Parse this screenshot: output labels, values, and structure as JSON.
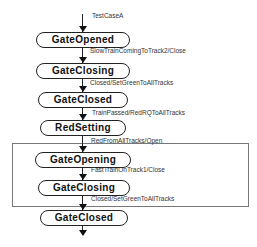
{
  "diagram": {
    "type": "state-transition",
    "initial_label": "TestCaseA",
    "states": [
      {
        "name": "GateOpened"
      },
      {
        "name": "GateClosing"
      },
      {
        "name": "GateClosed"
      },
      {
        "name": "RedSetting"
      },
      {
        "name": "GateOpening"
      },
      {
        "name": "GateClosing"
      },
      {
        "name": "GateClosed"
      }
    ],
    "transitions": [
      {
        "label": "SlowTrainComingToTrack2/Close"
      },
      {
        "label": "Closed/SetGreenToAllTracks"
      },
      {
        "label": "TrainPassed/RedRQToAllTracks"
      },
      {
        "label": "RedFromAllTracks/Open"
      },
      {
        "label": "FastTrainOnTrack1/Close"
      },
      {
        "label": "Closed/SetGreenToAllTracks"
      }
    ]
  }
}
